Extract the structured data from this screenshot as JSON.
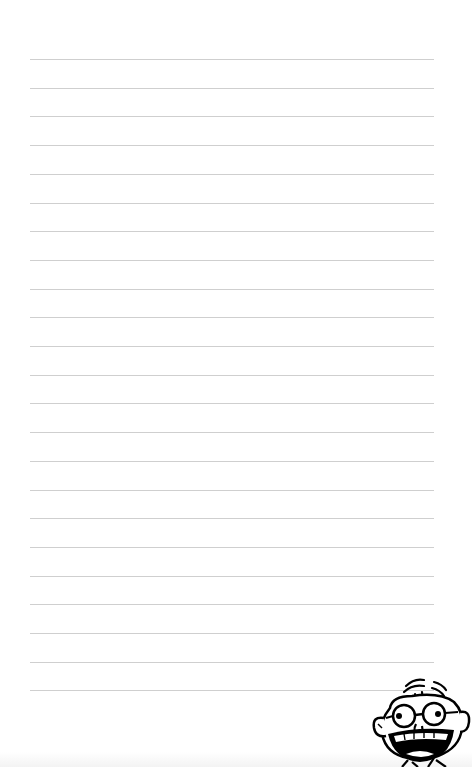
{
  "page": {
    "type": "lined-notebook-page",
    "background": "#ffffff",
    "rule_color": "#cfcfcf",
    "rule_count": 23,
    "rule_top_first": 59,
    "rule_spacing": 28.7,
    "rule_left": 30,
    "rule_width": 404
  },
  "mascot": {
    "icon": "cartoon-kid-face-icon",
    "description": "Cartoon boy with glasses and big open-mouth grin"
  }
}
